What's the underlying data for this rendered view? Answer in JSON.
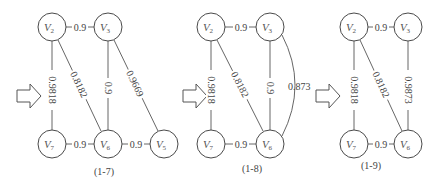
{
  "graphs": [
    {
      "caption": "(1-7)",
      "nodes": [
        {
          "id": "V2",
          "letter": "V",
          "sub": "2",
          "x": 52,
          "y": 27
        },
        {
          "id": "V3",
          "letter": "V",
          "sub": "3",
          "x": 108,
          "y": 27
        },
        {
          "id": "V7",
          "letter": "V",
          "sub": "7",
          "x": 52,
          "y": 144
        },
        {
          "id": "V6",
          "letter": "V",
          "sub": "6",
          "x": 108,
          "y": 144
        },
        {
          "id": "V5",
          "letter": "V",
          "sub": "5",
          "x": 164,
          "y": 144
        }
      ],
      "edges": [
        {
          "from": "V2",
          "to": "V3",
          "label": "0.9"
        },
        {
          "from": "V2",
          "to": "V7",
          "label": "0.9818"
        },
        {
          "from": "V2",
          "to": "V6",
          "label": "0.8182"
        },
        {
          "from": "V3",
          "to": "V6",
          "label": "0.9"
        },
        {
          "from": "V3",
          "to": "V5",
          "label": "0.9669"
        },
        {
          "from": "V7",
          "to": "V6",
          "label": "0.9"
        },
        {
          "from": "V6",
          "to": "V5",
          "label": "0.9"
        }
      ]
    },
    {
      "caption": "(1-8)",
      "nodes": [
        {
          "id": "V2",
          "letter": "V",
          "sub": "2",
          "x": 211,
          "y": 27
        },
        {
          "id": "V3",
          "letter": "V",
          "sub": "3",
          "x": 270,
          "y": 27
        },
        {
          "id": "V7",
          "letter": "V",
          "sub": "7",
          "x": 211,
          "y": 144
        },
        {
          "id": "V6",
          "letter": "V",
          "sub": "6",
          "x": 270,
          "y": 144
        }
      ],
      "edges": [
        {
          "from": "V2",
          "to": "V3",
          "label": "0.9"
        },
        {
          "from": "V2",
          "to": "V7",
          "label": "0.9818"
        },
        {
          "from": "V2",
          "to": "V6",
          "label": "0.8182"
        },
        {
          "from": "V3",
          "to": "V6",
          "label": "0.9"
        },
        {
          "from": "V3",
          "to": "V6",
          "label": "0.873",
          "curved": true
        },
        {
          "from": "V7",
          "to": "V6",
          "label": "0.9"
        }
      ]
    },
    {
      "caption": "(1-9)",
      "nodes": [
        {
          "id": "V2",
          "letter": "V",
          "sub": "2",
          "x": 354,
          "y": 27
        },
        {
          "id": "V3",
          "letter": "V",
          "sub": "3",
          "x": 408,
          "y": 27
        },
        {
          "id": "V7",
          "letter": "V",
          "sub": "7",
          "x": 354,
          "y": 144
        },
        {
          "id": "V6",
          "letter": "V",
          "sub": "6",
          "x": 408,
          "y": 144
        }
      ],
      "edges": [
        {
          "from": "V2",
          "to": "V3",
          "label": "0.9"
        },
        {
          "from": "V2",
          "to": "V7",
          "label": "0.9818"
        },
        {
          "from": "V2",
          "to": "V6",
          "label": "0.8182"
        },
        {
          "from": "V3",
          "to": "V6",
          "label": "0.9873"
        },
        {
          "from": "V7",
          "to": "V6",
          "label": "0.9"
        }
      ]
    }
  ],
  "arrows": [
    {
      "x": 17,
      "y": 96
    },
    {
      "x": 183,
      "y": 96
    },
    {
      "x": 316,
      "y": 96
    }
  ]
}
